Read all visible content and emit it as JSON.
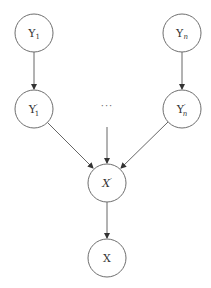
{
  "diagram": {
    "type": "directed-graph",
    "nodes": [
      {
        "id": "Y1",
        "label": "Y",
        "sub": "1",
        "prime": "",
        "cx": 34,
        "cy": 33
      },
      {
        "id": "Yn",
        "label": "Y",
        "sub": "n",
        "prime": "",
        "cx": 182,
        "cy": 33
      },
      {
        "id": "Y1p",
        "label": "Y",
        "sub": "1",
        "prime": "′",
        "cx": 34,
        "cy": 109
      },
      {
        "id": "Ynp",
        "label": "Y",
        "sub": "n",
        "prime": "′",
        "cx": 182,
        "cy": 109
      },
      {
        "id": "Xp",
        "label": "X",
        "sub": "",
        "prime": "′",
        "cx": 107,
        "cy": 183
      },
      {
        "id": "X",
        "label": "X",
        "sub": "",
        "prime": "",
        "cx": 107,
        "cy": 258
      }
    ],
    "ellipsis": "···",
    "edges": [
      {
        "from": "Y1",
        "to": "Y1p"
      },
      {
        "from": "Yn",
        "to": "Ynp"
      },
      {
        "from": "Y1p",
        "to": "Xp"
      },
      {
        "from": "ellipsis",
        "to": "Xp"
      },
      {
        "from": "Ynp",
        "to": "Xp"
      },
      {
        "from": "Xp",
        "to": "X"
      }
    ],
    "colors": {
      "stroke": "#6e6e6e",
      "edge": "#555555",
      "text": "#333333"
    }
  }
}
